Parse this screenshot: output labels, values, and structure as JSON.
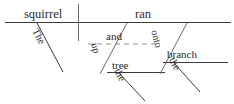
{
  "diagram": {
    "type": "reed-kellogg-sentence-diagram",
    "sentence": "The squirrel ran up the tree and onto the branch.",
    "ink_color": "#3a3a3a",
    "text_color": "#2b2b2b",
    "baseline": {
      "label": "main-baseline",
      "x1": 5,
      "y1": 22,
      "x2": 231,
      "y2": 22
    },
    "subject_predicate_divider": {
      "label": "subject-verb-divider",
      "x": 78,
      "y1": 4,
      "y2": 40
    },
    "words": {
      "subject": "squirrel",
      "verb": "ran",
      "subject_article": "The",
      "conjunction": "and",
      "preposition_1": "up",
      "object_1": "tree",
      "object_1_article": "the",
      "preposition_2": "onto",
      "object_2": "branch",
      "object_2_article": "the"
    },
    "phrases": [
      {
        "name": "prepositional-phrase-up-the-tree",
        "preposition": "up",
        "object": "tree",
        "article": "the"
      },
      {
        "name": "prepositional-phrase-onto-the-branch",
        "preposition": "onto",
        "object": "branch",
        "article": "the"
      }
    ],
    "conjunction_line": {
      "name": "dashed-conjunction-line",
      "style": "dashed",
      "x1": 88,
      "y1": 44,
      "x2": 158,
      "y2": 44
    }
  }
}
